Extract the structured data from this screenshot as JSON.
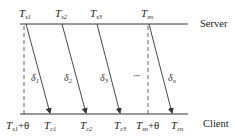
{
  "diagram": {
    "type": "timing-sequence",
    "lanes": {
      "server": {
        "label": "Server",
        "y": 24
      },
      "client": {
        "label": "Client",
        "y": 114
      }
    },
    "server_timestamps": [
      {
        "base": "T",
        "sub": "s1",
        "x": 26
      },
      {
        "base": "T",
        "sub": "s2",
        "x": 62
      },
      {
        "base": "T",
        "sub": "s3",
        "x": 97
      },
      {
        "base": "T",
        "sub": "sn",
        "x": 148
      }
    ],
    "client_timestamps": [
      {
        "base": "T",
        "sub": "s1",
        "suffix": "+θ",
        "x": 24
      },
      {
        "base": "T",
        "sub": "c1",
        "x": 50
      },
      {
        "base": "T",
        "sub": "c2",
        "x": 86
      },
      {
        "base": "T",
        "sub": "c3",
        "x": 120
      },
      {
        "base": "T",
        "sub": "sn",
        "suffix": "+θ",
        "x": 148
      },
      {
        "base": "T",
        "sub": "cn",
        "x": 172
      }
    ],
    "delays": [
      {
        "base": "δ",
        "sub": "1"
      },
      {
        "base": "δ",
        "sub": "2"
      },
      {
        "base": "δ",
        "sub": "3"
      },
      {
        "base": "δ",
        "sub": "n"
      }
    ],
    "ellipsis": "···",
    "colors": {
      "line": "#333333",
      "text": "#222222",
      "background": "#ffffff"
    }
  }
}
